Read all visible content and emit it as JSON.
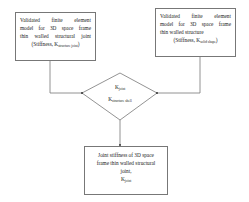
{
  "diagram": {
    "left_box": {
      "lines": [
        "Validated finite element",
        "model for 3D space frame",
        "thin walled structural joint"
      ],
      "stiffness_prefix": "(Stiffness, K",
      "stiffness_sub": "structure joint",
      "stiffness_suffix": ")"
    },
    "right_box": {
      "lines": [
        "Validated finite element",
        "model for 3D space frame",
        "thin walled structure"
      ],
      "stiffness_prefix": "(Stiffness, K",
      "stiffness_sub": "solid shape",
      "stiffness_suffix": ")"
    },
    "decision": {
      "line1_main": "K",
      "line1_sub": "joint",
      "line2_main": "K",
      "line2_sub": "structure shell"
    },
    "result_box": {
      "lines": [
        "Joint stiffness of 3D space",
        "frame thin walled structural",
        "joint,"
      ],
      "k_main": "K",
      "k_sub": "joint"
    },
    "colors": {
      "stroke": "#777777",
      "text": "#222222",
      "background": "#ffffff"
    }
  }
}
